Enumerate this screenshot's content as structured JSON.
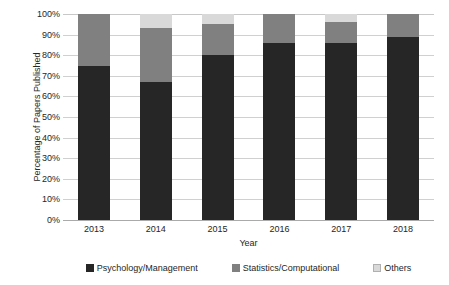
{
  "chart_data": {
    "type": "bar",
    "stacked": true,
    "stack_mode": "percent",
    "title": "",
    "xlabel": "Year",
    "ylabel": "Percentage of Papers Published",
    "categories": [
      "2013",
      "2014",
      "2015",
      "2016",
      "2017",
      "2018"
    ],
    "ylim": [
      0,
      100
    ],
    "ytick_labels": [
      "0%",
      "10%",
      "20%",
      "30%",
      "40%",
      "50%",
      "60%",
      "70%",
      "80%",
      "90%",
      "100%"
    ],
    "ytick_values": [
      0,
      10,
      20,
      30,
      40,
      50,
      60,
      70,
      80,
      90,
      100
    ],
    "grid": true,
    "grid_axis": "y",
    "legend_position": "bottom",
    "series": [
      {
        "name": "Psychology/Management",
        "color": "#262626",
        "values": [
          75,
          67,
          80,
          86,
          86,
          89
        ]
      },
      {
        "name": "Statistics/Computational",
        "color": "#808080",
        "values": [
          25,
          26,
          15,
          14,
          10,
          11
        ]
      },
      {
        "name": "Others",
        "color": "#d9d9d9",
        "values": [
          0,
          7,
          5,
          0,
          4,
          0
        ]
      }
    ]
  }
}
